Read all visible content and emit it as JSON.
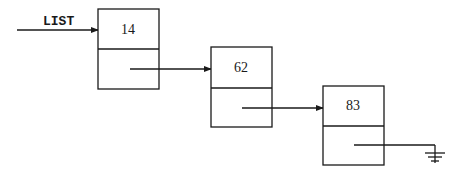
{
  "diagram": {
    "type": "singly-linked-list",
    "head_label": "LIST",
    "nodes": [
      {
        "value": "14"
      },
      {
        "value": "62"
      },
      {
        "value": "83"
      }
    ],
    "terminator": "null-ground-symbol",
    "colors": {
      "stroke": "#1a1a1a",
      "background": "#ffffff"
    }
  }
}
